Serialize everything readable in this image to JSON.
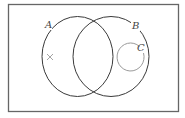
{
  "diagram": {
    "type": "venn",
    "universe": {
      "x": 8,
      "y": 4,
      "width": 170,
      "height": 107,
      "stroke": "#666666"
    },
    "sets": [
      {
        "id": "A",
        "label": "A",
        "cx": 77.5,
        "cy": 56.5,
        "rx": 35.5,
        "ry": 40,
        "stroke": "#3a3a3a",
        "label_x": 46,
        "label_y": 28
      },
      {
        "id": "B",
        "label": "B",
        "cx": 111,
        "cy": 56.5,
        "rx": 38,
        "ry": 40,
        "stroke": "#3a3a3a",
        "label_x": 133,
        "label_y": 29
      },
      {
        "id": "C",
        "label": "C",
        "cx": 130.5,
        "cy": 57,
        "rx": 13.5,
        "ry": 14,
        "stroke": "#9a9a9a",
        "label_x": 137,
        "label_y": 51
      }
    ],
    "marker": {
      "symbol": "×",
      "x": 50,
      "y": 57,
      "color": "#9a9a9a",
      "region": "A only"
    }
  }
}
